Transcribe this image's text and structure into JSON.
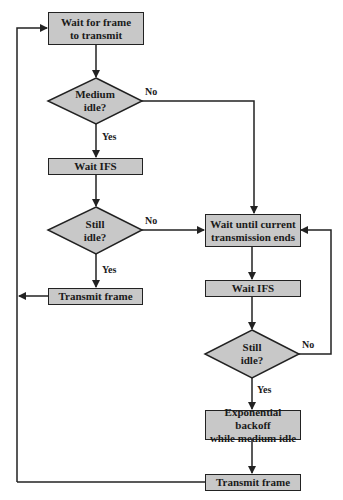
{
  "diagram": {
    "type": "flowchart",
    "colors": {
      "node_fill": "#c8c8c8",
      "stroke": "#222222",
      "background": "#ffffff"
    },
    "nodes": [
      {
        "id": "wait_frame",
        "shape": "rect",
        "text_line1": "Wait for frame",
        "text_line2": "to transmit"
      },
      {
        "id": "medium_idle",
        "shape": "diamond",
        "text_line1": "Medium",
        "text_line2": "idle?"
      },
      {
        "id": "wait_ifs_1",
        "shape": "rect",
        "text": "Wait IFS"
      },
      {
        "id": "still_idle_1",
        "shape": "diamond",
        "text_line1": "Still",
        "text_line2": "idle?"
      },
      {
        "id": "transmit_1",
        "shape": "rect",
        "text": "Transmit frame"
      },
      {
        "id": "wait_current",
        "shape": "rect",
        "text_line1": "Wait until current",
        "text_line2": "transmission ends"
      },
      {
        "id": "wait_ifs_2",
        "shape": "rect",
        "text": "Wait IFS"
      },
      {
        "id": "still_idle_2",
        "shape": "diamond",
        "text_line1": "Still",
        "text_line2": "idle?"
      },
      {
        "id": "backoff",
        "shape": "rect",
        "text_line1": "Exponential backoff",
        "text_line2": "while medium idle"
      },
      {
        "id": "transmit_2",
        "shape": "rect",
        "text": "Transmit frame"
      }
    ],
    "edge_labels": {
      "medium_idle_no": "No",
      "medium_idle_yes": "Yes",
      "still_idle_1_no": "No",
      "still_idle_1_yes": "Yes",
      "still_idle_2_no": "No",
      "still_idle_2_yes": "Yes"
    },
    "edges": [
      {
        "from": "wait_frame",
        "to": "medium_idle"
      },
      {
        "from": "medium_idle",
        "to": "wait_ifs_1",
        "label": "Yes"
      },
      {
        "from": "medium_idle",
        "to": "wait_current",
        "label": "No"
      },
      {
        "from": "wait_ifs_1",
        "to": "still_idle_1"
      },
      {
        "from": "still_idle_1",
        "to": "transmit_1",
        "label": "Yes"
      },
      {
        "from": "still_idle_1",
        "to": "wait_current",
        "label": "No"
      },
      {
        "from": "transmit_1",
        "to": "wait_frame"
      },
      {
        "from": "wait_current",
        "to": "wait_ifs_2"
      },
      {
        "from": "wait_ifs_2",
        "to": "still_idle_2"
      },
      {
        "from": "still_idle_2",
        "to": "backoff",
        "label": "Yes"
      },
      {
        "from": "still_idle_2",
        "to": "wait_current",
        "label": "No"
      },
      {
        "from": "backoff",
        "to": "transmit_2"
      },
      {
        "from": "transmit_2",
        "to": "wait_frame"
      }
    ]
  }
}
